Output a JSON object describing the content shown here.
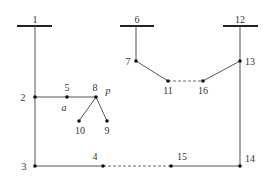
{
  "diagram": {
    "buses": [
      {
        "id": "1",
        "label": "1"
      },
      {
        "id": "6",
        "label": "6"
      },
      {
        "id": "12",
        "label": "12"
      }
    ],
    "nodes": [
      {
        "id": "2",
        "label": "2"
      },
      {
        "id": "3",
        "label": "3"
      },
      {
        "id": "4",
        "label": "4"
      },
      {
        "id": "5",
        "label": "5"
      },
      {
        "id": "7",
        "label": "7"
      },
      {
        "id": "8",
        "label": "8"
      },
      {
        "id": "9",
        "label": "9"
      },
      {
        "id": "10",
        "label": "10"
      },
      {
        "id": "11",
        "label": "11"
      },
      {
        "id": "13",
        "label": "13"
      },
      {
        "id": "14",
        "label": "14"
      },
      {
        "id": "15",
        "label": "15"
      },
      {
        "id": "16",
        "label": "16"
      }
    ],
    "annotations": {
      "a": "a",
      "p": "p"
    },
    "edges_solid": [
      [
        "1",
        "2"
      ],
      [
        "2",
        "5"
      ],
      [
        "5",
        "8"
      ],
      [
        "8",
        "10"
      ],
      [
        "8",
        "9"
      ],
      [
        "2",
        "3"
      ],
      [
        "3",
        "4"
      ],
      [
        "15",
        "14"
      ],
      [
        "14",
        "13"
      ],
      [
        "13",
        "12"
      ],
      [
        "13",
        "16"
      ],
      [
        "6",
        "7"
      ],
      [
        "7",
        "11"
      ]
    ],
    "edges_dashed": [
      [
        "4",
        "15"
      ],
      [
        "11",
        "16"
      ]
    ]
  }
}
